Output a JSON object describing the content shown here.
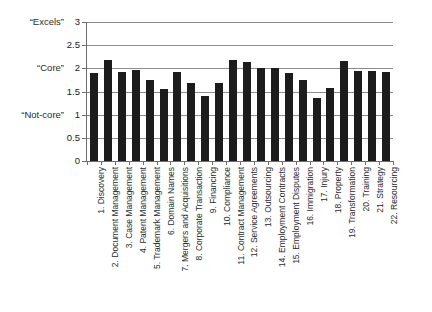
{
  "chart_data": {
    "type": "bar",
    "title": "",
    "xlabel": "",
    "ylabel": "",
    "ylim": [
      0,
      3
    ],
    "grid": true,
    "legend": "none",
    "bar_color": "#1c1c1c",
    "grid_color": "#8c8c8c",
    "yticks": [
      "3",
      "2.5",
      "2",
      "1.5",
      "1",
      "0.5",
      "0"
    ],
    "ytick_values": [
      3,
      2.5,
      2,
      1.5,
      1,
      0.5,
      0
    ],
    "anchor_labels": [
      {
        "text": "“Excels”",
        "value": 3
      },
      {
        "text": "“Core”",
        "value": 2
      },
      {
        "text": "“Not-core”",
        "value": 1
      }
    ],
    "categories": [
      "1. Discovery",
      "2. Document Management",
      "3. Case Management",
      "4. Patent Management",
      "5. Trademark Management",
      "6. Domain Names",
      "7. Mergers and Acquisitions",
      "8. Corporate Transaction",
      "9. Financing",
      "10. Compliance",
      "11. Contract Management",
      "12. Service Agreements",
      "13. Outsourcing",
      "14. Employment Contracts",
      "15. Employment Disputes",
      "16. Immigration",
      "17. Injury",
      "18. Property",
      "19. Transformation",
      "20. Training",
      "21. Strategy",
      "22. Resourcing"
    ],
    "values": [
      1.9,
      2.18,
      1.92,
      1.96,
      1.75,
      1.56,
      1.92,
      1.69,
      1.4,
      1.69,
      2.18,
      2.13,
      2.0,
      2.0,
      1.9,
      1.75,
      1.36,
      1.58,
      2.15,
      1.95,
      1.95,
      1.93
    ]
  }
}
